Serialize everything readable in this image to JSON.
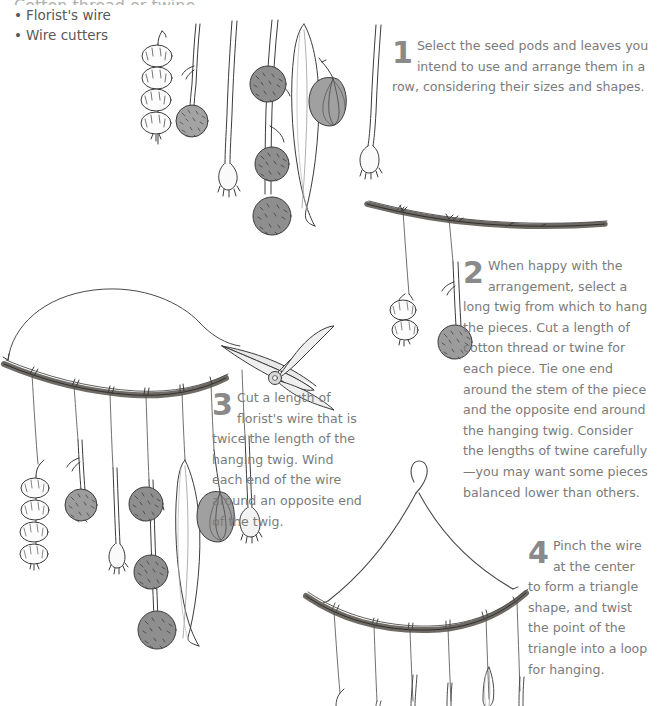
{
  "page": {
    "kind": "craft-instruction-page",
    "background": "#ffffff",
    "text_color": "#7b7b7b",
    "number_color": "#8a8a8a",
    "twig_color": "#6f6a63",
    "pod_color": "#9a9a9a",
    "lantern_color": "#a6a6a6"
  },
  "materials": {
    "clipped_line": "Cotton thread or twine",
    "items": [
      {
        "label": "Florist's wire"
      },
      {
        "label": "Wire cutters"
      }
    ]
  },
  "steps": [
    {
      "number": "1",
      "text": "Select the seed pods and leaves you intend to use and arrange them in a row, considering their sizes and shapes."
    },
    {
      "number": "2",
      "text": "When happy with the arrangement, select a long twig from which to hang the pieces. Cut a length of cotton thread or twine for each piece. Tie one end around the stem of the piece and the opposite end around the hanging twig. Consider the lengths of twine carefully—you may want some pieces balanced lower than others."
    },
    {
      "number": "3",
      "text": "Cut a length of florist's wire that is twice the length of the hanging twig. Wind each end of the wire around an opposite end of the twig."
    },
    {
      "number": "4",
      "text": "Pinch the wire at the center to form a triangle shape, and twist the point of the triangle into a loop for hanging."
    }
  ],
  "illustrations": [
    {
      "id": "row-of-pods",
      "caption": "Row of seed pods and leaves arranged side by side",
      "elements": [
        "four-lobed-seed-pod-string",
        "round-fuzzy-gumnut",
        "small-bell-pod",
        "triple-gumnut-branch",
        "long-eucalyptus-leaf",
        "gray-chinese-lantern-pod",
        "slim-bell-pod"
      ]
    },
    {
      "id": "hanging-twig",
      "caption": "Long twig with two pieces tied on with twine",
      "elements": [
        "twig",
        "twine-thread",
        "two-lobed-pod",
        "round-fuzzy-gumnut"
      ]
    },
    {
      "id": "wired-mobile",
      "caption": "Twig mobile with florist's wire arch and pruning shears",
      "elements": [
        "wire-arch",
        "twig",
        "pruning-shears",
        "hanging-pieces"
      ]
    },
    {
      "id": "triangle-mobile",
      "caption": "Finished mobile with wire pinched into a triangle and loop",
      "elements": [
        "wire-triangle",
        "hanging-loop",
        "twig",
        "twine-threads"
      ]
    }
  ]
}
